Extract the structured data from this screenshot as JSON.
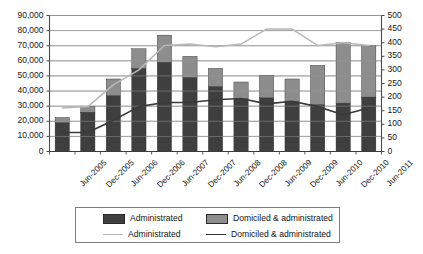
{
  "chart_data": {
    "type": "bar",
    "title": "",
    "subtitle": "",
    "xlabel": "",
    "ylabel": "",
    "y2label": "",
    "grid": true,
    "legend_position": "bottom",
    "categories": [
      "Jun-2005",
      "Dec-2005",
      "Jun-2006",
      "Dec-2006",
      "Jun-2007",
      "Dec-2007",
      "Jun-2008",
      "Dec-2008",
      "Jun-2009",
      "Dec-2009",
      "Jun-2010",
      "Dec-2010",
      "Jun-2011"
    ],
    "ylim": [
      0,
      90000
    ],
    "yticks": [
      0,
      10000,
      20000,
      30000,
      40000,
      50000,
      60000,
      70000,
      80000,
      90000
    ],
    "ytick_labels": [
      "0",
      "10,000",
      "20,000",
      "30,000",
      "40,000",
      "50,000",
      "60,000",
      "70,000",
      "80,000",
      "90,000"
    ],
    "y2lim": [
      0,
      500
    ],
    "y2ticks": [
      0,
      50,
      100,
      150,
      200,
      250,
      300,
      350,
      400,
      450,
      500
    ],
    "y2tick_labels": [
      "0",
      "50",
      "100",
      "150",
      "200",
      "250",
      "300",
      "350",
      "400",
      "450",
      "500"
    ],
    "stacked": true,
    "series": [
      {
        "name": "Administrated",
        "kind": "bar",
        "axis": "left",
        "color": "#3f3f3f",
        "values": [
          19000,
          26000,
          37000,
          55000,
          59000,
          49000,
          43000,
          35000,
          35500,
          33000,
          31000,
          32000,
          36000
        ]
      },
      {
        "name": "Domiciled & administrated",
        "kind": "bar",
        "axis": "left",
        "color": "#8d8d8d",
        "values": [
          3500,
          4000,
          11000,
          13000,
          18000,
          14000,
          12000,
          11000,
          15000,
          15000,
          26000,
          40000,
          34000
        ],
        "stack_totals": [
          22500,
          30000,
          48000,
          68000,
          77000,
          63000,
          55000,
          46000,
          50500,
          48000,
          57000,
          72000,
          70000
        ]
      },
      {
        "name": "Administrated",
        "kind": "line",
        "axis": "right",
        "color": "#b8b8b8",
        "values": [
          160,
          165,
          245,
          300,
          390,
          395,
          385,
          395,
          450,
          450,
          390,
          400,
          390
        ]
      },
      {
        "name": "Domiciled & administrated",
        "kind": "line",
        "axis": "right",
        "color": "#3a3a3a",
        "values": [
          70,
          70,
          115,
          165,
          180,
          180,
          190,
          195,
          175,
          185,
          165,
          135,
          160
        ]
      }
    ]
  },
  "legend": {
    "entries": [
      {
        "label": "Administrated",
        "marker": "bar-swatch",
        "color": "#3f3f3f"
      },
      {
        "label": "Domiciled & administrated",
        "marker": "bar-swatch",
        "color": "#8d8d8d"
      },
      {
        "label": "Administrated",
        "marker": "line-swatch",
        "color": "#b8b8b8"
      },
      {
        "label": "Domiciled & administrated",
        "marker": "line-swatch",
        "color": "#3a3a3a"
      }
    ]
  },
  "colors": {
    "bar_dark": "#3f3f3f",
    "bar_light": "#8d8d8d",
    "line_light": "#b8b8b8",
    "line_dark": "#3a3a3a",
    "axis": "#5a5a5a",
    "grid": "#8f8f8f",
    "background": "#ffffff"
  }
}
